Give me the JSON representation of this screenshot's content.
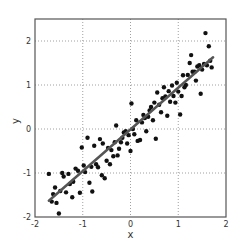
{
  "chart_data": {
    "type": "scatter",
    "title": "",
    "xlabel": "x",
    "ylabel": "y",
    "xlim": [
      -2,
      2
    ],
    "ylim": [
      -2,
      2.5
    ],
    "xticks": [
      -2,
      -1,
      0,
      1,
      2
    ],
    "yticks": [
      -2,
      -1,
      0,
      1,
      2
    ],
    "xtick_labels": [
      "-2",
      "-1",
      "0",
      "1",
      "2"
    ],
    "ytick_labels": [
      "-2",
      "-1",
      "0",
      "1",
      "2"
    ],
    "grid": true,
    "grid_style": "dotted",
    "legend": null,
    "point_color": "#111111",
    "line_color": "#555555",
    "fit_line": {
      "x": [
        -1.71,
        1.73
      ],
      "y": [
        -1.63,
        1.63
      ]
    },
    "points": [
      [
        -1.71,
        -1.02
      ],
      [
        -1.65,
        -1.65
      ],
      [
        -1.62,
        -1.48
      ],
      [
        -1.58,
        -1.33
      ],
      [
        -1.55,
        -1.68
      ],
      [
        -1.5,
        -1.92
      ],
      [
        -1.47,
        -1.41
      ],
      [
        -1.43,
        -1.0
      ],
      [
        -1.4,
        -1.08
      ],
      [
        -1.35,
        -1.44
      ],
      [
        -1.3,
        -1.02
      ],
      [
        -1.27,
        -1.25
      ],
      [
        -1.22,
        -1.55
      ],
      [
        -1.2,
        -1.2
      ],
      [
        -1.15,
        -0.9
      ],
      [
        -1.1,
        -0.95
      ],
      [
        -1.06,
        -1.45
      ],
      [
        -1.02,
        -0.42
      ],
      [
        -0.98,
        -0.83
      ],
      [
        -0.95,
        -0.98
      ],
      [
        -0.9,
        -0.2
      ],
      [
        -0.86,
        -1.22
      ],
      [
        -0.82,
        -0.86
      ],
      [
        -0.8,
        -1.42
      ],
      [
        -0.76,
        -0.38
      ],
      [
        -0.72,
        -0.8
      ],
      [
        -0.68,
        -0.87
      ],
      [
        -0.64,
        -0.23
      ],
      [
        -0.6,
        -1.05
      ],
      [
        -0.58,
        -0.33
      ],
      [
        -0.54,
        -1.12
      ],
      [
        -0.5,
        -0.72
      ],
      [
        -0.47,
        -0.43
      ],
      [
        -0.43,
        -0.8
      ],
      [
        -0.4,
        -0.48
      ],
      [
        -0.36,
        -0.62
      ],
      [
        -0.33,
        -0.3
      ],
      [
        -0.3,
        0.08
      ],
      [
        -0.27,
        -0.6
      ],
      [
        -0.24,
        -0.45
      ],
      [
        -0.2,
        -0.3
      ],
      [
        -0.17,
        -0.2
      ],
      [
        -0.14,
        -0.08
      ],
      [
        -0.1,
        -0.05
      ],
      [
        -0.07,
        -0.33
      ],
      [
        -0.04,
        -0.14
      ],
      [
        0.0,
        -0.5
      ],
      [
        0.02,
        0.58
      ],
      [
        0.05,
        -0.0
      ],
      [
        0.08,
        -0.12
      ],
      [
        0.12,
        0.2
      ],
      [
        0.15,
        -0.27
      ],
      [
        0.2,
        -0.25
      ],
      [
        0.24,
        0.15
      ],
      [
        0.27,
        0.32
      ],
      [
        0.3,
        0.25
      ],
      [
        0.33,
        -0.05
      ],
      [
        0.37,
        0.28
      ],
      [
        0.4,
        0.42
      ],
      [
        0.43,
        0.5
      ],
      [
        0.47,
        0.2
      ],
      [
        0.5,
        0.6
      ],
      [
        0.53,
        -0.22
      ],
      [
        0.56,
        0.83
      ],
      [
        0.6,
        0.55
      ],
      [
        0.64,
        0.38
      ],
      [
        0.67,
        0.7
      ],
      [
        0.7,
        0.95
      ],
      [
        0.73,
        0.74
      ],
      [
        0.77,
        0.3
      ],
      [
        0.8,
        0.86
      ],
      [
        0.83,
        0.62
      ],
      [
        0.87,
        0.99
      ],
      [
        0.9,
        0.75
      ],
      [
        0.94,
        0.6
      ],
      [
        0.97,
        1.05
      ],
      [
        1.0,
        0.85
      ],
      [
        1.04,
        0.33
      ],
      [
        1.07,
        0.75
      ],
      [
        1.1,
        1.22
      ],
      [
        1.13,
        0.95
      ],
      [
        1.16,
        1.0
      ],
      [
        1.2,
        1.23
      ],
      [
        1.24,
        1.5
      ],
      [
        1.27,
        1.68
      ],
      [
        1.3,
        1.3
      ],
      [
        1.34,
        1.3
      ],
      [
        1.37,
        1.1
      ],
      [
        1.4,
        1.42
      ],
      [
        1.44,
        1.45
      ],
      [
        1.47,
        0.8
      ],
      [
        1.5,
        1.35
      ],
      [
        1.54,
        1.48
      ],
      [
        1.57,
        2.18
      ],
      [
        1.6,
        1.45
      ],
      [
        1.64,
        1.88
      ],
      [
        1.67,
        1.55
      ],
      [
        1.7,
        1.4
      ]
    ]
  }
}
